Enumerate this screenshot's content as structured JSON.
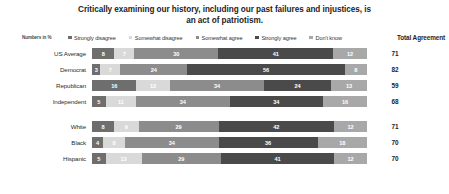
{
  "chart_data": {
    "type": "bar",
    "subtype": "stacked-horizontal-100",
    "title": "Critically examining our history, including our past failures and injustices, is an act of patriotism.",
    "note": "Numbers in %",
    "total_header": "Total Agreement",
    "xlabel": "",
    "ylabel": "",
    "xlim": [
      0,
      100
    ],
    "grid": false,
    "legend_position": "top",
    "series": [
      {
        "name": "Strongly disagree",
        "color": "#6e6e6e",
        "values": [
          8,
          3,
          16,
          5,
          8,
          4,
          5
        ]
      },
      {
        "name": "Somewhat disagree",
        "color": "#d9d9d9",
        "values": [
          7,
          7,
          12,
          11,
          9,
          8,
          13
        ]
      },
      {
        "name": "Somewhat agree",
        "color": "#8c8c8c",
        "values": [
          30,
          24,
          34,
          34,
          29,
          34,
          29
        ]
      },
      {
        "name": "Strongly agree",
        "color": "#4a4a4a",
        "values": [
          41,
          56,
          24,
          34,
          42,
          36,
          41
        ]
      },
      {
        "name": "Don't know",
        "color": "#a8a8a8",
        "values": [
          12,
          8,
          13,
          16,
          12,
          18,
          12
        ]
      }
    ],
    "groups": [
      {
        "rows": [
          {
            "category": "US Average",
            "values": [
              8,
              7,
              30,
              41,
              12
            ],
            "total_agreement": 71
          },
          {
            "category": "Democrat",
            "values": [
              3,
              7,
              24,
              56,
              8
            ],
            "total_agreement": 82
          },
          {
            "category": "Republican",
            "values": [
              16,
              12,
              34,
              24,
              13
            ],
            "total_agreement": 59
          },
          {
            "category": "Independent",
            "values": [
              5,
              11,
              34,
              34,
              16
            ],
            "total_agreement": 68
          }
        ]
      },
      {
        "rows": [
          {
            "category": "White",
            "values": [
              8,
              9,
              29,
              42,
              12
            ],
            "total_agreement": 71
          },
          {
            "category": "Black",
            "values": [
              4,
              8,
              34,
              36,
              18
            ],
            "total_agreement": 70
          },
          {
            "category": "Hispanic",
            "values": [
              5,
              13,
              29,
              41,
              12
            ],
            "total_agreement": 70
          }
        ]
      }
    ]
  }
}
